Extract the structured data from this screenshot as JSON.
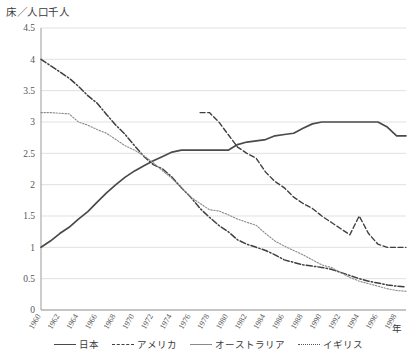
{
  "chart_data": {
    "type": "line",
    "title": "",
    "ylabel": "床／人口千人",
    "xlabel": "年",
    "ylim": [
      0,
      4.5
    ],
    "ytick_labels": [
      "0",
      "0.5",
      "1",
      "1.5",
      "2",
      "2.5",
      "3",
      "3.5",
      "4",
      "4.5"
    ],
    "ytick_values": [
      0,
      0.5,
      1,
      1.5,
      2,
      2.5,
      3,
      3.5,
      4,
      4.5
    ],
    "grid": true,
    "legend_position": "bottom",
    "xlim": [
      1960,
      1999
    ],
    "x": [
      1960,
      1961,
      1962,
      1963,
      1964,
      1965,
      1966,
      1967,
      1968,
      1969,
      1970,
      1971,
      1972,
      1973,
      1974,
      1975,
      1976,
      1977,
      1978,
      1979,
      1980,
      1981,
      1982,
      1983,
      1984,
      1985,
      1986,
      1987,
      1988,
      1989,
      1990,
      1991,
      1992,
      1993,
      1994,
      1995,
      1996,
      1997,
      1998,
      1999
    ],
    "xtick_labels": [
      "1960",
      "1962",
      "1964",
      "1966",
      "1968",
      "1970",
      "1972",
      "1974",
      "1976",
      "1978",
      "1980",
      "1982",
      "1984",
      "1986",
      "1988",
      "1990",
      "1992",
      "1994",
      "1996",
      "1998"
    ],
    "series": [
      {
        "name": "日本",
        "style": "solid",
        "color": "#4a4a4a",
        "x": [
          1960,
          1961,
          1962,
          1963,
          1964,
          1965,
          1966,
          1967,
          1968,
          1969,
          1970,
          1971,
          1972,
          1973,
          1974,
          1975,
          1976,
          1977,
          1978,
          1979,
          1980,
          1981,
          1982,
          1983,
          1984,
          1985,
          1986,
          1987,
          1988,
          1989,
          1990,
          1991,
          1992,
          1993,
          1994,
          1995,
          1996,
          1997,
          1998,
          1999
        ],
        "values": [
          1.0,
          1.1,
          1.22,
          1.32,
          1.45,
          1.57,
          1.72,
          1.87,
          2.0,
          2.12,
          2.22,
          2.3,
          2.38,
          2.45,
          2.52,
          2.55,
          2.55,
          2.55,
          2.55,
          2.55,
          2.55,
          2.64,
          2.68,
          2.7,
          2.72,
          2.78,
          2.8,
          2.82,
          2.9,
          2.97,
          3.0,
          3.0,
          3.0,
          3.0,
          3.0,
          3.0,
          3.0,
          2.92,
          2.78,
          2.78
        ]
      },
      {
        "name": "アメリカ",
        "style": "dashdot",
        "color": "#3f3f3f",
        "x": [
          1960,
          1961,
          1962,
          1963,
          1964,
          1965,
          1966,
          1967,
          1968,
          1969,
          1970,
          1971,
          1972,
          1973,
          1974,
          1975,
          1976,
          1977,
          1978,
          1979,
          1980,
          1981,
          1982,
          1983,
          1984,
          1985,
          1986,
          1987,
          1988,
          1989,
          1990,
          1991,
          1992,
          1993,
          1994,
          1995,
          1996,
          1997,
          1998,
          1999
        ],
        "values": [
          4.0,
          3.9,
          3.8,
          3.7,
          3.57,
          3.42,
          3.3,
          3.12,
          2.95,
          2.8,
          2.62,
          2.45,
          2.32,
          2.25,
          2.12,
          1.95,
          1.8,
          1.62,
          1.48,
          1.35,
          1.25,
          1.12,
          1.05,
          1.0,
          0.95,
          0.88,
          0.8,
          0.76,
          0.72,
          0.7,
          0.68,
          0.65,
          0.6,
          0.55,
          0.5,
          0.46,
          0.43,
          0.4,
          0.38,
          0.37
        ]
      },
      {
        "name": "オーストラリア",
        "style": "dotted-thin",
        "color": "#8a8a8a",
        "x": [
          1960,
          1961,
          1962,
          1963,
          1964,
          1965,
          1966,
          1967,
          1968,
          1969,
          1970,
          1971,
          1972,
          1973,
          1974,
          1975,
          1976,
          1977,
          1978,
          1979,
          1980,
          1981,
          1982,
          1983,
          1984,
          1985,
          1986,
          1987,
          1988,
          1989,
          1990,
          1991,
          1992,
          1993,
          1994,
          1995,
          1996,
          1997,
          1998,
          1999
        ],
        "values": [
          3.15,
          3.15,
          3.14,
          3.13,
          3.0,
          2.95,
          2.88,
          2.82,
          2.72,
          2.62,
          2.55,
          2.46,
          2.35,
          2.22,
          2.1,
          1.95,
          1.8,
          1.7,
          1.6,
          1.58,
          1.52,
          1.45,
          1.4,
          1.35,
          1.22,
          1.1,
          1.02,
          0.95,
          0.88,
          0.8,
          0.72,
          0.68,
          0.6,
          0.52,
          0.46,
          0.42,
          0.38,
          0.34,
          0.31,
          0.3
        ]
      },
      {
        "name": "イギリス",
        "style": "dashed",
        "color": "#3f3f3f",
        "x": [
          1977,
          1978,
          1979,
          1980,
          1981,
          1982,
          1983,
          1984,
          1985,
          1986,
          1987,
          1988,
          1989,
          1990,
          1991,
          1992,
          1993,
          1994,
          1995,
          1996,
          1997,
          1998,
          1999
        ],
        "values": [
          3.15,
          3.15,
          3.0,
          2.8,
          2.6,
          2.5,
          2.42,
          2.2,
          2.05,
          1.95,
          1.8,
          1.7,
          1.62,
          1.5,
          1.4,
          1.3,
          1.2,
          1.5,
          1.22,
          1.05,
          1.0,
          1.0,
          1.0
        ]
      }
    ]
  },
  "axis": {
    "y_title": "床／人口千人",
    "x_title": "年"
  }
}
